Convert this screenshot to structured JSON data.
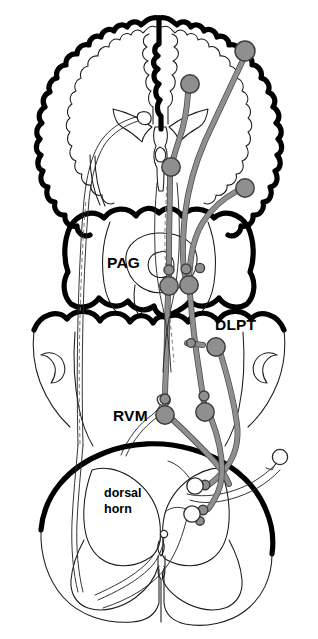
{
  "figure": {
    "background_color": "#ffffff",
    "ink_color": "#000000",
    "neuron_fill_color": "#8f8f8f",
    "neuron_stroke_color": "#3d3d3d",
    "unfilled_neuron_color": "#ffffff"
  },
  "labels": {
    "pag": "PAG",
    "dlpt": "DLPT",
    "rvm": "RVM",
    "dorsal_horn_line1": "dorsal",
    "dorsal_horn_line2": "horn"
  },
  "structures": [
    {
      "id": "cerebral-cortex",
      "name": "cerebral cortex"
    },
    {
      "id": "midbrain",
      "name": "midbrain"
    },
    {
      "id": "pons-medulla",
      "name": "pons and medulla"
    },
    {
      "id": "spinal-cord",
      "name": "spinal cord"
    }
  ],
  "neurons": {
    "filled": [
      {
        "id": "cortex-lateral-neuron",
        "x": 245,
        "y": 51,
        "r": 10.0
      },
      {
        "id": "cortex-medial-neuron",
        "x": 190,
        "y": 84,
        "r": 9.2
      },
      {
        "id": "thalamus-neuron",
        "x": 171,
        "y": 167,
        "r": 9.2
      },
      {
        "id": "cortex-right-low-neuron",
        "x": 245,
        "y": 188,
        "r": 9.2
      },
      {
        "id": "pag-left-neuron",
        "x": 169,
        "y": 286,
        "r": 9.2
      },
      {
        "id": "pag-right-neuron",
        "x": 189,
        "y": 285,
        "r": 9.2
      },
      {
        "id": "dlpt-neuron",
        "x": 216,
        "y": 347,
        "r": 9.2
      },
      {
        "id": "rvm-left-neuron",
        "x": 165,
        "y": 415,
        "r": 9.2
      },
      {
        "id": "rvm-right-neuron",
        "x": 205,
        "y": 412,
        "r": 9.2
      }
    ],
    "unfilled": [
      {
        "id": "dorsal-horn-projection-neuron",
        "x": 195,
        "y": 486,
        "r": 8.2
      },
      {
        "id": "dorsal-horn-interneuron",
        "x": 192,
        "y": 514,
        "r": 8.2
      },
      {
        "id": "primary-afferent-neuron",
        "x": 280,
        "y": 457,
        "r": 7.6
      },
      {
        "id": "central-canal",
        "x": 164,
        "y": 534,
        "r": 3.6
      }
    ]
  },
  "pathways": [
    {
      "id": "cortico-pag-tract",
      "type": "descending",
      "color": "#8f8f8f"
    },
    {
      "id": "cortico-rvm-tract",
      "type": "descending",
      "color": "#8f8f8f"
    },
    {
      "id": "pag-rvm-tract",
      "type": "descending",
      "color": "#8f8f8f"
    },
    {
      "id": "rvm-spinal-tract",
      "type": "descending",
      "color": "#8f8f8f"
    },
    {
      "id": "dlpt-spinal-tract",
      "type": "descending",
      "color": "#8f8f8f"
    },
    {
      "id": "spinothalamic-tract",
      "type": "ascending",
      "color": "#ffffff"
    },
    {
      "id": "primary-afferent-input",
      "type": "afferent",
      "color": "#ffffff"
    }
  ]
}
